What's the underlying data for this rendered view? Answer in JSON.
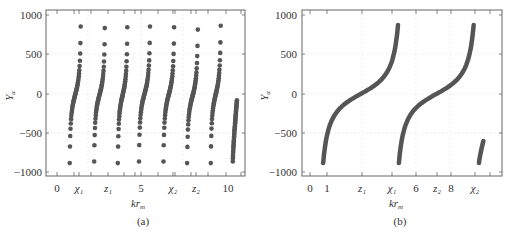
{
  "chart_data": [
    {
      "type": "scatter",
      "panel": "(a)",
      "title": "",
      "xlabel": "kr_m",
      "ylabel": "Y_a",
      "xlim": [
        -0.6,
        11.2
      ],
      "ylim": [
        -1080,
        1060
      ],
      "yticks": [
        -1000,
        -500,
        0,
        500,
        1000
      ],
      "xticks": [
        {
          "value": 0,
          "label": "0"
        },
        {
          "value": 1.85,
          "label": "χ₁"
        },
        {
          "value": 3.25,
          "label": "z₁"
        },
        {
          "value": 5,
          "label": "5"
        },
        {
          "value": 7.0,
          "label": "χ₂"
        },
        {
          "value": 8.4,
          "label": "z₂"
        },
        {
          "value": 10,
          "label": "10"
        }
      ],
      "grid": true,
      "marker": "filled-circle",
      "series": [
        {
          "name": "branch-1",
          "x_range": [
            0.75,
            2.2
          ],
          "y_range": [
            -880,
            860
          ]
        },
        {
          "name": "branch-2",
          "x_range": [
            2.2,
            3.6
          ],
          "y_range": [
            -860,
            840
          ]
        },
        {
          "name": "branch-3",
          "x_range": [
            3.6,
            4.85
          ],
          "y_range": [
            -880,
            850
          ]
        },
        {
          "name": "branch-4",
          "x_range": [
            4.85,
            6.3
          ],
          "y_range": [
            -860,
            860
          ]
        },
        {
          "name": "branch-5",
          "x_range": [
            6.3,
            7.7
          ],
          "y_range": [
            -860,
            850
          ]
        },
        {
          "name": "branch-6",
          "x_range": [
            7.7,
            9.1
          ],
          "y_range": [
            -880,
            820
          ]
        },
        {
          "name": "branch-7",
          "x_range": [
            9.1,
            10.4
          ],
          "y_range": [
            -880,
            870
          ]
        },
        {
          "name": "branch-8",
          "x_range": [
            10.4,
            10.95
          ],
          "y_range": [
            -860,
            -80
          ]
        }
      ]
    },
    {
      "type": "line",
      "panel": "(b)",
      "title": "",
      "xlabel": "kr_m",
      "ylabel": "Y_a",
      "xlim": [
        -0.45,
        11.1
      ],
      "ylim": [
        -1080,
        1060
      ],
      "yticks": [
        -1000,
        -500,
        0,
        500,
        1000
      ],
      "xticks": [
        {
          "value": 0,
          "label": "0"
        },
        {
          "value": 1,
          "label": "1"
        },
        {
          "value": 3.0,
          "label": "z₁"
        },
        {
          "value": 4.6,
          "label": "χ₁"
        },
        {
          "value": 6,
          "label": "6"
        },
        {
          "value": 7.2,
          "label": "z₂"
        },
        {
          "value": 8,
          "label": "8"
        },
        {
          "value": 9.4,
          "label": "χ₂"
        }
      ],
      "grid": true,
      "series": [
        {
          "name": "branch-1",
          "x_range": [
            0.75,
            5.0
          ],
          "y_range": [
            -880,
            880
          ]
        },
        {
          "name": "branch-2",
          "x_range": [
            5.05,
            9.3
          ],
          "y_range": [
            -880,
            880
          ]
        },
        {
          "name": "branch-3",
          "x_range": [
            9.6,
            9.85
          ],
          "y_range": [
            -880,
            -600
          ]
        }
      ]
    }
  ],
  "panels": {
    "a": {
      "caption": "(a)",
      "xlabel": "kr",
      "xlabel_sub": "m",
      "ylabel": "Y",
      "ylabel_sub": "a",
      "yticks": [
        "1000",
        "500",
        "0",
        "−500",
        "−1000"
      ],
      "xticks": [
        "0",
        "χ₁",
        "z₁",
        "5",
        "χ₂",
        "z₂",
        "10"
      ]
    },
    "b": {
      "caption": "(b)",
      "xlabel": "kr",
      "xlabel_sub": "m",
      "ylabel": "Y",
      "ylabel_sub": "a",
      "yticks": [
        "1000",
        "500",
        "0",
        "−500",
        "−1000"
      ],
      "xticks": [
        "0",
        "1",
        "z₁",
        "χ₁",
        "6",
        "z₂",
        "8",
        "χ₂"
      ]
    }
  },
  "colors": {
    "curve": "#555555",
    "frame": "#666666",
    "grid": "#e2e2e2"
  }
}
